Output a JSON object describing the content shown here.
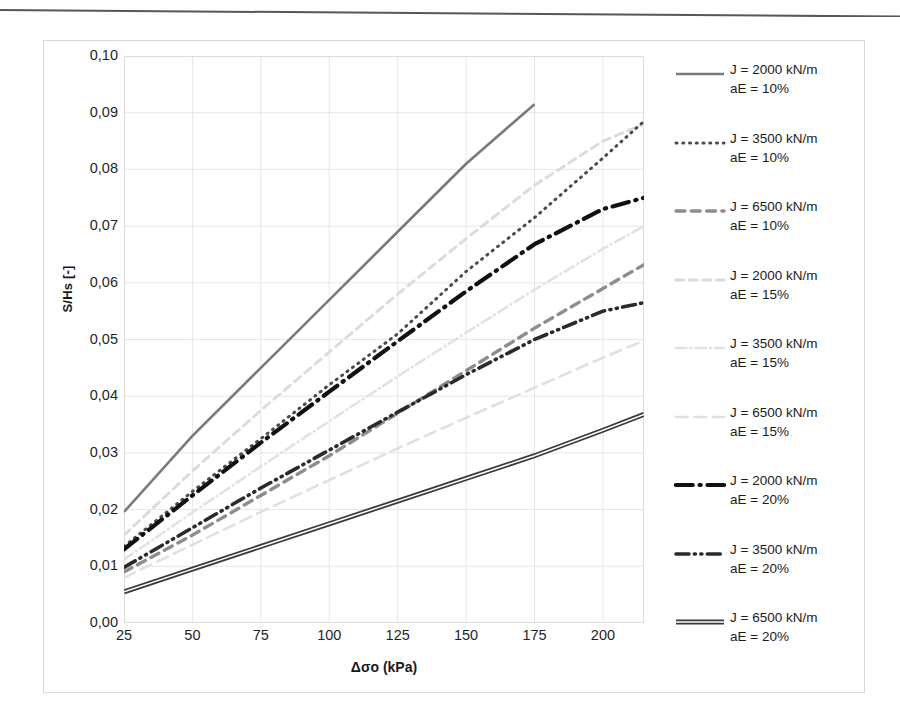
{
  "figure": {
    "y_axis_title": "S/Hs [-]",
    "x_axis_title": "Δσo (kPa)",
    "y_ticks": [
      "0,10",
      "0,09",
      "0,08",
      "0,07",
      "0,06",
      "0,05",
      "0,04",
      "0,03",
      "0,02",
      "0,01",
      "0,00"
    ],
    "x_ticks": [
      "25",
      "50",
      "75",
      "100",
      "125",
      "150",
      "175",
      "200"
    ]
  },
  "legend": {
    "items": [
      {
        "line1": "J = 2000 kN/m",
        "line2": "aE = 10%",
        "style": "solid",
        "color": "#7a7a7a",
        "width": 2.6,
        "key": "legend-key-j2000-ae10"
      },
      {
        "line1": "J = 3500 kN/m",
        "line2": "aE = 10%",
        "style": "dotted",
        "color": "#4a4a4a",
        "width": 3.0,
        "key": "legend-key-j3500-ae10"
      },
      {
        "line1": "J = 6500 kN/m",
        "line2": "aE = 10%",
        "style": "dashed",
        "color": "#8d8d8d",
        "width": 3.4,
        "key": "legend-key-j6500-ae10"
      },
      {
        "line1": "J = 2000 kN/m",
        "line2": "aE = 15%",
        "style": "dashed",
        "color": "#dcdcdc",
        "width": 3.0,
        "key": "legend-key-j2000-ae15"
      },
      {
        "line1": "J = 3500 kN/m",
        "line2": "aE = 15%",
        "style": "dashdot",
        "color": "#e2e2e2",
        "width": 2.6,
        "key": "legend-key-j3500-ae15"
      },
      {
        "line1": "J = 6500 kN/m",
        "line2": "aE = 15%",
        "style": "longdash",
        "color": "#e0e0e0",
        "width": 2.6,
        "key": "legend-key-j6500-ae15"
      },
      {
        "line1": "J = 2000 kN/m",
        "line2": "aE = 20%",
        "style": "dashdot",
        "color": "#111111",
        "width": 4.2,
        "key": "legend-key-j2000-ae20"
      },
      {
        "line1": "J = 3500 kN/m",
        "line2": "aE = 20%",
        "style": "dashdotdot",
        "color": "#2a2a2a",
        "width": 3.6,
        "key": "legend-key-j3500-ae20"
      },
      {
        "line1": "J = 6500 kN/m",
        "line2": "aE = 20%",
        "style": "double",
        "color": "#3a3a3a",
        "width": 3.4,
        "key": "legend-key-j6500-ae20"
      }
    ]
  },
  "chart_data": {
    "type": "line",
    "title": "",
    "xlabel": "Δσo (kPa)",
    "ylabel": "S/Hs [-]",
    "xlim": [
      25,
      215
    ],
    "ylim": [
      0.0,
      0.1
    ],
    "grid": true,
    "legend_position": "right",
    "x": [
      25,
      50,
      75,
      100,
      125,
      150,
      175,
      200,
      215
    ],
    "series": [
      {
        "name": "J = 2000 kN/m, aE = 10%",
        "J": 2000,
        "aE": "10%",
        "style": "solid",
        "color": "#7a7a7a",
        "width": 2.6,
        "x": [
          25,
          50,
          75,
          100,
          125,
          150,
          175
        ],
        "values": [
          0.0196,
          0.033,
          0.045,
          0.057,
          0.069,
          0.081,
          0.0915
        ]
      },
      {
        "name": "J = 3500 kN/m, aE = 10%",
        "J": 3500,
        "aE": "10%",
        "style": "dotted",
        "color": "#4a4a4a",
        "width": 3.0,
        "x": [
          25,
          50,
          75,
          100,
          125,
          150,
          175,
          200,
          215
        ],
        "values": [
          0.0135,
          0.0232,
          0.0325,
          0.042,
          0.051,
          0.062,
          0.0715,
          0.082,
          0.0885
        ]
      },
      {
        "name": "J = 6500 kN/m, aE = 10%",
        "J": 6500,
        "aE": "10%",
        "style": "dashed",
        "color": "#8d8d8d",
        "width": 3.4,
        "x": [
          25,
          50,
          75,
          100,
          125,
          150,
          175,
          200,
          215
        ],
        "values": [
          0.009,
          0.0155,
          0.0225,
          0.0295,
          0.037,
          0.0445,
          0.052,
          0.059,
          0.0632
        ]
      },
      {
        "name": "J = 2000 kN/m, aE = 15%",
        "J": 2000,
        "aE": "15%",
        "style": "dashed",
        "color": "#dcdcdc",
        "width": 3.0,
        "x": [
          25,
          50,
          75,
          100,
          125,
          150,
          175,
          200,
          215
        ],
        "values": [
          0.0155,
          0.0268,
          0.0375,
          0.0478,
          0.058,
          0.0678,
          0.0772,
          0.085,
          0.088
        ]
      },
      {
        "name": "J = 3500 kN/m, aE = 15%",
        "J": 3500,
        "aE": "15%",
        "style": "dashdot",
        "color": "#e2e2e2",
        "width": 2.6,
        "x": [
          25,
          50,
          75,
          100,
          125,
          150,
          175,
          200,
          215
        ],
        "values": [
          0.0112,
          0.0195,
          0.0276,
          0.0356,
          0.0435,
          0.0512,
          0.0588,
          0.066,
          0.07
        ]
      },
      {
        "name": "J = 6500 kN/m, aE = 15%",
        "J": 6500,
        "aE": "15%",
        "style": "longdash",
        "color": "#e0e0e0",
        "width": 2.6,
        "x": [
          25,
          50,
          75,
          100,
          125,
          150,
          175,
          200,
          215
        ],
        "values": [
          0.008,
          0.0138,
          0.0196,
          0.0252,
          0.0308,
          0.0362,
          0.0415,
          0.0468,
          0.0498
        ]
      },
      {
        "name": "J = 2000 kN/m, aE = 20%",
        "J": 2000,
        "aE": "20%",
        "style": "dashdot",
        "color": "#111111",
        "width": 4.2,
        "x": [
          25,
          50,
          75,
          100,
          125,
          150,
          175,
          200,
          215
        ],
        "values": [
          0.013,
          0.0225,
          0.0318,
          0.0408,
          0.0497,
          0.0585,
          0.0668,
          0.073,
          0.075
        ]
      },
      {
        "name": "J = 3500 kN/m, aE = 20%",
        "J": 3500,
        "aE": "20%",
        "style": "dashdotdot",
        "color": "#2a2a2a",
        "width": 3.6,
        "x": [
          25,
          50,
          75,
          100,
          125,
          150,
          175,
          200,
          215
        ],
        "values": [
          0.0098,
          0.0168,
          0.0238,
          0.0305,
          0.0372,
          0.0438,
          0.05,
          0.055,
          0.0565
        ]
      },
      {
        "name": "J = 6500 kN/m, aE = 20%",
        "J": 6500,
        "aE": "20%",
        "style": "double",
        "color": "#3a3a3a",
        "width": 3.4,
        "x": [
          25,
          50,
          75,
          100,
          125,
          150,
          175,
          200,
          215
        ],
        "values": [
          0.0055,
          0.0095,
          0.0135,
          0.0175,
          0.0215,
          0.0255,
          0.0295,
          0.034,
          0.0368
        ]
      }
    ]
  }
}
